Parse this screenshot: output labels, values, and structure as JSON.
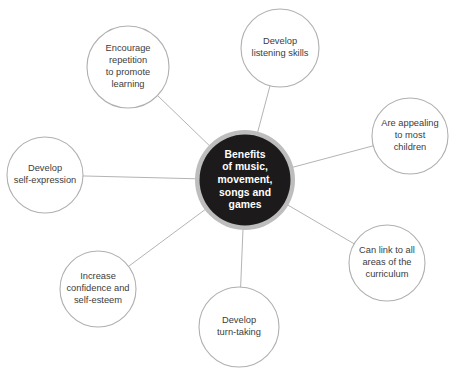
{
  "diagram": {
    "type": "hub-and-spoke-mind-map",
    "width": 454,
    "height": 372,
    "background_color": "#ffffff",
    "line_color": "#b4b4b4",
    "node_stroke_color": "#b0b0b0",
    "node_fill_color": "#ffffff",
    "node_text_color": "#3c3c3c",
    "hub": {
      "lines": [
        "Benefits",
        "of music,",
        "movement,",
        "songs and",
        "games"
      ],
      "text": "Benefits of music, movement, songs and games",
      "cx": 245,
      "cy": 180,
      "ring_radius": 50,
      "core_radius": 45.5,
      "ring_color": "#bdbdbd",
      "core_color": "#1c1a1a",
      "text_color": "#ffffff"
    },
    "nodes": [
      {
        "id": "develop-listening-skills",
        "lines": [
          "Develop",
          "listening skills"
        ],
        "text": "Develop listening skills",
        "cx": 280,
        "cy": 48,
        "r": 39
      },
      {
        "id": "encourage-repetition",
        "lines": [
          "Encourage",
          "repetition",
          "to promote",
          "learning"
        ],
        "text": "Encourage repetition to promote learning",
        "cx": 128,
        "cy": 67,
        "r": 41
      },
      {
        "id": "are-appealing-to-most-children",
        "lines": [
          "Are appealing",
          "to most",
          "children"
        ],
        "text": "Are appealing to most children",
        "cx": 410,
        "cy": 136,
        "r": 38
      },
      {
        "id": "develop-self-expression",
        "lines": [
          "Develop",
          "self-expression"
        ],
        "text": "Develop self-expression",
        "cx": 45,
        "cy": 175,
        "r": 38
      },
      {
        "id": "can-link-to-curriculum",
        "lines": [
          "Can link to all",
          "areas of the",
          "curriculum"
        ],
        "text": "Can link to all areas of the curriculum",
        "cx": 387,
        "cy": 263,
        "r": 38
      },
      {
        "id": "increase-confidence",
        "lines": [
          "Increase",
          "confidence and",
          "self-esteem"
        ],
        "text": "Increase confidence and self-esteem",
        "cx": 98,
        "cy": 289,
        "r": 38
      },
      {
        "id": "develop-turn-taking",
        "lines": [
          "Develop",
          "turn-taking"
        ],
        "text": "Develop turn-taking",
        "cx": 239,
        "cy": 327,
        "r": 40
      }
    ]
  }
}
